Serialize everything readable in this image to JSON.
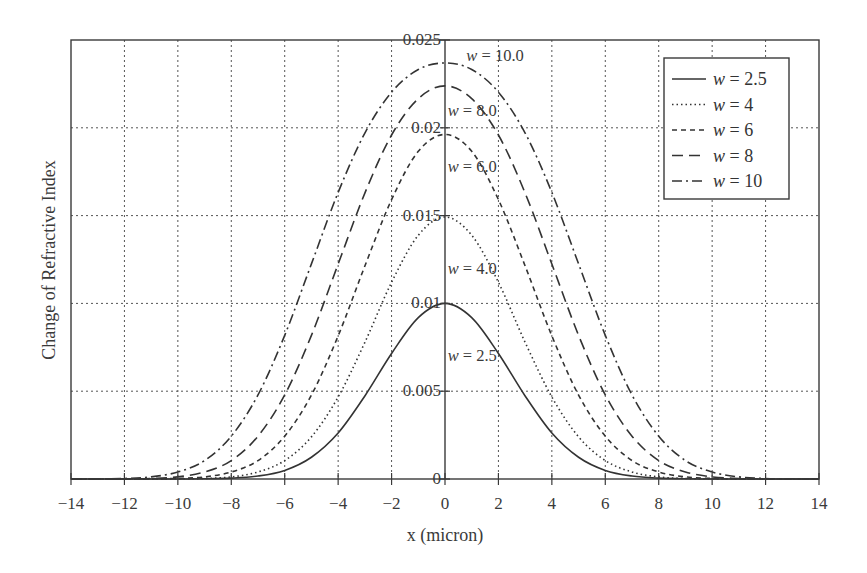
{
  "chart_data": {
    "type": "line",
    "title": "",
    "xlabel": "x (micron)",
    "ylabel": "Change of Refractive Index",
    "xlim": [
      -14,
      14
    ],
    "ylim": [
      0,
      0.025
    ],
    "xticks": [
      -14,
      -12,
      -10,
      -8,
      -6,
      -4,
      -2,
      0,
      2,
      4,
      6,
      8,
      10,
      12,
      14
    ],
    "xtick_labels": [
      "−14",
      "−12",
      "−10",
      "−8",
      "−6",
      "−4",
      "−2",
      "0",
      "2",
      "4",
      "6",
      "8",
      "10",
      "12",
      "14"
    ],
    "yticks": [
      0,
      0.005,
      0.01,
      0.015,
      0.02,
      0.025
    ],
    "ytick_labels": [
      "0",
      "0.005",
      "0.01",
      "0.015",
      "0.02",
      "0.025"
    ],
    "grid": true,
    "legend_position": "upper right",
    "x": [
      -14,
      -13,
      -12,
      -11,
      -10,
      -9,
      -8,
      -7,
      -6,
      -5,
      -4,
      -3,
      -2,
      -1,
      0,
      1,
      2,
      3,
      4,
      5,
      6,
      7,
      8,
      9,
      10,
      11,
      12,
      13,
      14
    ],
    "series": [
      {
        "name": "w = 2.5",
        "legend_var": "w",
        "legend_value": "= 2.5",
        "style": "solid",
        "values": [
          0,
          0,
          0,
          0,
          0,
          1e-05,
          5e-05,
          0.00017,
          0.00049,
          0.00124,
          0.00262,
          0.00473,
          0.00715,
          0.00919,
          0.01,
          0.00919,
          0.00715,
          0.00473,
          0.00262,
          0.00124,
          0.00049,
          0.00017,
          5e-05,
          1e-05,
          0,
          0,
          0,
          0,
          0
        ]
      },
      {
        "name": "w = 4",
        "legend_var": "w",
        "legend_value": "= 4",
        "style": "dotted",
        "values": [
          0,
          0,
          0,
          0,
          1e-05,
          3e-05,
          0.00012,
          0.0004,
          0.00105,
          0.0024,
          0.00467,
          0.00778,
          0.0112,
          0.01388,
          0.01492,
          0.01388,
          0.0112,
          0.00778,
          0.00467,
          0.0024,
          0.00105,
          0.0004,
          0.00012,
          3e-05,
          1e-05,
          0,
          0,
          0,
          0
        ]
      },
      {
        "name": "w = 6",
        "legend_var": "w",
        "legend_value": "= 6",
        "style": "short-dash",
        "values": [
          0,
          0,
          0,
          1e-05,
          3e-05,
          0.00012,
          0.0004,
          0.00105,
          0.00244,
          0.00478,
          0.00815,
          0.01213,
          0.01591,
          0.01866,
          0.01962,
          0.01866,
          0.01591,
          0.01213,
          0.00815,
          0.00478,
          0.00244,
          0.00105,
          0.0004,
          0.00012,
          3e-05,
          1e-05,
          0,
          0,
          0
        ]
      },
      {
        "name": "w = 8",
        "legend_var": "w",
        "legend_value": "= 8",
        "style": "long-dash",
        "values": [
          0,
          0,
          1e-05,
          3e-05,
          0.00012,
          0.0004,
          0.00105,
          0.00244,
          0.00479,
          0.00818,
          0.01224,
          0.01628,
          0.01959,
          0.02166,
          0.02239,
          0.02166,
          0.01959,
          0.01628,
          0.01224,
          0.00818,
          0.00479,
          0.00244,
          0.00105,
          0.0004,
          0.00012,
          3e-05,
          1e-05,
          0,
          0
        ]
      },
      {
        "name": "w = 10",
        "legend_var": "w",
        "legend_value": "= 10",
        "style": "dash-dot",
        "values": [
          0,
          1e-05,
          3e-05,
          0.00012,
          0.0004,
          0.00105,
          0.00244,
          0.00479,
          0.00818,
          0.01225,
          0.01632,
          0.0197,
          0.02203,
          0.02332,
          0.02369,
          0.02332,
          0.02203,
          0.0197,
          0.01632,
          0.01225,
          0.00818,
          0.00479,
          0.00244,
          0.00105,
          0.0004,
          0.00012,
          3e-05,
          1e-05,
          0
        ]
      }
    ],
    "annotations": [
      {
        "var": "w",
        "text": "= 10.0",
        "x": 0.8,
        "y": 0.0238
      },
      {
        "var": "w",
        "text": "= 8.0",
        "x": 0.1,
        "y": 0.0207
      },
      {
        "var": "w",
        "text": "= 6.0",
        "x": 0.1,
        "y": 0.0175
      },
      {
        "var": "w",
        "text": "= 4.0",
        "x": 0.1,
        "y": 0.0117
      },
      {
        "var": "w",
        "text": "= 2.5",
        "x": 0.1,
        "y": 0.0067
      }
    ]
  },
  "colors": {
    "line": "#333333",
    "grid": "#555555",
    "frame": "#3a3a3a",
    "background": "#ffffff"
  }
}
